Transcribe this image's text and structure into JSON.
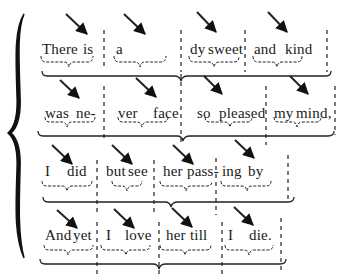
{
  "diagram": {
    "type": "poetry-scansion",
    "rows": [
      {
        "feet": [
          {
            "syllables": [
              "There",
              "is"
            ]
          },
          {
            "syllables": [
              "a",
              "la-"
            ]
          },
          {
            "syllables": [
              "dy",
              "sweet"
            ]
          },
          {
            "syllables": [
              "and",
              "kind"
            ]
          }
        ]
      },
      {
        "feet": [
          {
            "syllables": [
              "was",
              "ne-"
            ]
          },
          {
            "syllables": [
              "ver",
              "face"
            ]
          },
          {
            "syllables": [
              "so",
              "pleased"
            ]
          },
          {
            "syllables": [
              "my",
              "mind,"
            ]
          }
        ]
      },
      {
        "feet": [
          {
            "syllables": [
              "I",
              "did"
            ]
          },
          {
            "syllables": [
              "but",
              "see"
            ]
          },
          {
            "syllables": [
              "her",
              "pass-"
            ]
          },
          {
            "syllables": [
              "ing",
              "by"
            ]
          }
        ]
      },
      {
        "feet": [
          {
            "syllables": [
              "And",
              "yet"
            ]
          },
          {
            "syllables": [
              "I",
              "love"
            ]
          },
          {
            "syllables": [
              "her",
              "till"
            ]
          },
          {
            "syllables": [
              "I",
              "die."
            ]
          }
        ]
      }
    ],
    "annotations": {
      "stress_marker": "arrow-down-right on second syllable of each foot",
      "foot_divider": "dashed vertical line",
      "foot_grouping": "small underbrace under each foot",
      "line_grouping": "long underbrace under each pair of feet",
      "stanza_grouping": "large left curly brace"
    }
  }
}
